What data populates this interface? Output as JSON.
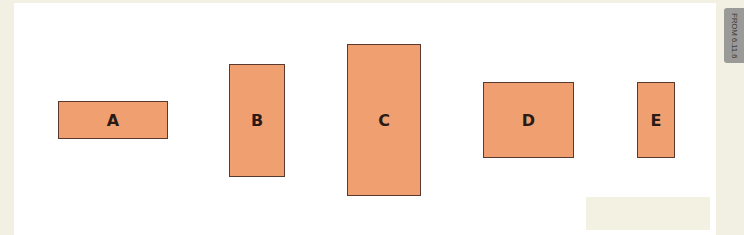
{
  "figure": {
    "side_tab": {
      "text": "FROM 6.11.6"
    },
    "colors": {
      "box_fill": "#f0a070",
      "box_border": "#5a3a2e",
      "background": "#ffffff",
      "margin": "#f1f0e2"
    },
    "shapes": [
      {
        "label": "A",
        "x": 58,
        "y": 101,
        "w": 110,
        "h": 38
      },
      {
        "label": "B",
        "x": 229,
        "y": 64,
        "w": 56,
        "h": 113
      },
      {
        "label": "C",
        "x": 347,
        "y": 44,
        "w": 74,
        "h": 152
      },
      {
        "label": "D",
        "x": 483,
        "y": 82,
        "w": 91,
        "h": 76
      },
      {
        "label": "E",
        "x": 637,
        "y": 82,
        "w": 38,
        "h": 76
      }
    ]
  }
}
